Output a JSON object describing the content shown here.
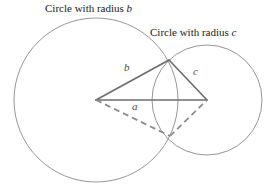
{
  "figure": {
    "width": 268,
    "height": 187,
    "background": "#ffffff"
  },
  "captions": {
    "circle_b": {
      "prefix": "Circle with radius ",
      "variable": "b"
    },
    "circle_c": {
      "prefix": "Circle with radius ",
      "variable": "c"
    }
  },
  "side_labels": {
    "b": "b",
    "a": "a",
    "c": "c"
  },
  "colors": {
    "circle_stroke": "#8a8a8a",
    "solid_line": "#6e6e6e",
    "dashed_line": "#8a8a8a",
    "text": "#1a1a1a",
    "label_text": "#4a4a4a"
  },
  "geometry": {
    "circle_b": {
      "cx": 96,
      "cy": 100,
      "r": 82,
      "radius_name": "b"
    },
    "circle_c": {
      "cx": 207,
      "cy": 100,
      "r": 55,
      "radius_name": "c"
    },
    "vertices": {
      "left_center": {
        "x": 96,
        "y": 100
      },
      "right_center": {
        "x": 207,
        "y": 100
      },
      "top_intersection": {
        "x": 169,
        "y": 60
      },
      "bottom_intersection": {
        "x": 170,
        "y": 136
      }
    },
    "solid_edges": [
      {
        "name": "b",
        "from": "left_center",
        "to": "top_intersection"
      },
      {
        "name": "c",
        "from": "top_intersection",
        "to": "right_center"
      },
      {
        "name": "a",
        "from": "left_center",
        "to": "right_center"
      }
    ],
    "dashed_edges": [
      {
        "from": "left_center",
        "to": "bottom_intersection"
      },
      {
        "from": "bottom_intersection",
        "to": "right_center"
      }
    ]
  }
}
